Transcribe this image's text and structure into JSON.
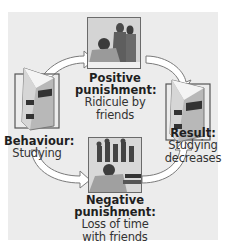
{
  "diagram": {
    "behaviour": {
      "title": "Behaviour:",
      "desc": "Studying",
      "icon": "book-icon"
    },
    "positive": {
      "title_line1": "Positive",
      "title_line2": "punishment:",
      "desc_line1": "Ridicule by",
      "desc_line2": "friends",
      "icon": "photo-ridicule"
    },
    "negative": {
      "title_line1": "Negative",
      "title_line2": "punishment:",
      "desc_line1": "Loss of time",
      "desc_line2": "with friends",
      "icon": "photo-studying-alone"
    },
    "result": {
      "title": "Result:",
      "desc_line1": "Studying",
      "desc_line2": "decreases",
      "icon": "book-icon"
    }
  },
  "colors": {
    "panel": "#ececec",
    "arrow_fill": "#ffffff",
    "arrow_stroke": "#7a7a7a",
    "text": "#1f1f1f"
  }
}
